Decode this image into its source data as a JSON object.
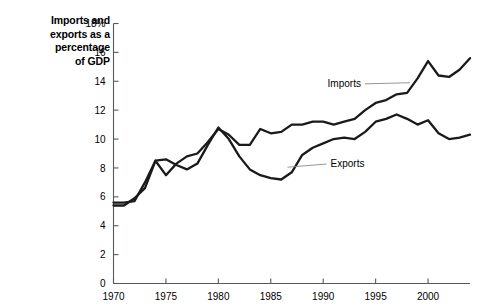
{
  "chart_data": {
    "type": "line",
    "title": "Imports and\nexports as a\npercentage\nof GDP",
    "xlabel": "",
    "ylabel": "",
    "xlim": [
      1970,
      2004
    ],
    "ylim": [
      0,
      18
    ],
    "grid": false,
    "legend_position": "inline-annotations",
    "y_ticks": [
      0,
      2,
      4,
      6,
      8,
      10,
      12,
      14,
      16,
      18
    ],
    "y_tick_labels": [
      "0",
      "2",
      "4",
      "6",
      "8",
      "10",
      "12",
      "14",
      "16",
      "18%"
    ],
    "x_ticks": [
      1970,
      1975,
      1980,
      1985,
      1990,
      1995,
      2000
    ],
    "x_tick_labels": [
      "1970",
      "1975",
      "1980",
      "1985",
      "1990",
      "1995",
      "2000"
    ],
    "x": [
      1970,
      1971,
      1972,
      1973,
      1974,
      1975,
      1976,
      1977,
      1978,
      1979,
      1980,
      1981,
      1982,
      1983,
      1984,
      1985,
      1986,
      1987,
      1988,
      1989,
      1990,
      1991,
      1992,
      1993,
      1994,
      1995,
      1996,
      1997,
      1998,
      1999,
      2000,
      2001,
      2002,
      2003,
      2004
    ],
    "series": [
      {
        "name": "Imports",
        "color": "#1a1a1a",
        "values": [
          5.4,
          5.4,
          5.9,
          6.6,
          8.5,
          7.5,
          8.3,
          8.8,
          9.0,
          9.8,
          10.7,
          10.3,
          9.6,
          9.6,
          10.7,
          10.4,
          10.5,
          11.0,
          11.0,
          11.2,
          11.2,
          11.0,
          11.2,
          11.4,
          12.0,
          12.5,
          12.7,
          13.1,
          13.2,
          14.2,
          15.4,
          14.4,
          14.3,
          14.8,
          15.6
        ]
      },
      {
        "name": "Exports",
        "color": "#1a1a1a",
        "values": [
          5.6,
          5.6,
          5.7,
          7.0,
          8.5,
          8.6,
          8.2,
          7.9,
          8.3,
          9.6,
          10.8,
          10.0,
          8.8,
          7.9,
          7.5,
          7.3,
          7.2,
          7.7,
          8.9,
          9.4,
          9.7,
          10.0,
          10.1,
          10.0,
          10.5,
          11.2,
          11.4,
          11.7,
          11.4,
          11.0,
          11.3,
          10.4,
          10.0,
          10.1,
          10.3
        ]
      }
    ],
    "annotations": [
      {
        "label": "Imports",
        "x": 1993.6,
        "y": 13.6,
        "leader_to_x": 1998.3,
        "leader_to_y": 13.9,
        "align": "end"
      },
      {
        "label": "Exports",
        "x": 1990.7,
        "y": 8.05,
        "leader_to_x": 1986.6,
        "leader_to_y": 8.05,
        "align": "start"
      }
    ]
  }
}
